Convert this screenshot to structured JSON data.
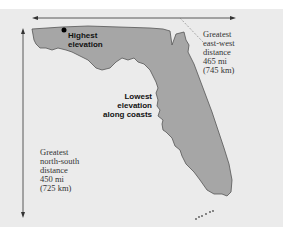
{
  "map": {
    "region": "Florida",
    "colors": {
      "background": "#ebebeb",
      "land_fill": "#a6a6a6",
      "outline": "#555555",
      "arrow": "#333333",
      "leader_line": "#777777"
    },
    "labels": {
      "highest_elevation": [
        "Highest",
        "elevation"
      ],
      "lowest_elevation": [
        "Lowest",
        "elevation",
        "along coasts"
      ],
      "east_west": {
        "lines": [
          "Greatest",
          "east-west",
          "distance",
          "465 mi",
          "(745 km)"
        ],
        "miles": "465 mi",
        "km": "(745 km)"
      },
      "north_south": {
        "lines": [
          "Greatest",
          "north-south",
          "distance",
          "450 mi",
          "(725 km)"
        ],
        "miles": "450 mi",
        "km": "(725 km)"
      }
    },
    "markers": {
      "highest_point": "black-dot"
    }
  }
}
